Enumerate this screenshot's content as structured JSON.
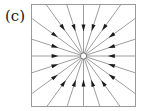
{
  "figure": {
    "panel_label": "(c)",
    "caption_text": ""
  },
  "frame": {
    "x": 31,
    "y": 4,
    "width": 104,
    "height": 102,
    "stroke_color": "#9a9a9a",
    "stroke_width": 1,
    "fill_color": "#ffffff"
  },
  "center": {
    "x": 83.5,
    "y": 56,
    "marker": "open-circle",
    "radius": 3.1,
    "stroke_color": "#7a7a7a",
    "fill_color": "#ffffff"
  },
  "chart_data": {
    "type": "scatter",
    "title": "(c)",
    "subtitle": "",
    "xlabel": "",
    "ylabel": "",
    "xlim": [
      -1,
      1
    ],
    "ylim": [
      -1,
      1
    ],
    "grid": false,
    "legend": null,
    "axes_visible": false,
    "field_type": "stable node (sink)",
    "flow_direction": "inward",
    "ray_count": 20,
    "ray_angle_step_deg": 18,
    "ray_angles_deg": [
      0,
      18,
      36,
      54,
      72,
      90,
      108,
      126,
      144,
      162,
      180,
      198,
      216,
      234,
      252,
      270,
      288,
      306,
      324,
      342
    ],
    "arrowhead_radius_fraction": 0.55,
    "line_color": "#8c8c8c",
    "arrow_color": "#1a1a1a",
    "annotations": [
      {
        "text": "(c)",
        "x": 5,
        "y": 9,
        "role": "panel-label"
      }
    ]
  }
}
